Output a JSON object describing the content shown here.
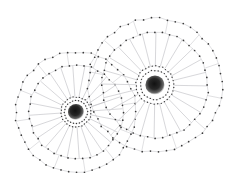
{
  "figure": {
    "background_color": "#ffffff",
    "width": 226,
    "height": 186
  },
  "style": {
    "rim_line_color": "#b9b9bf",
    "spoke_line_color": "#d2d2d6",
    "hub_ring_line_color": "#b0b0b6",
    "node_color": "#3a3a3a",
    "node_radius": 0.85,
    "rim_line_width": 0.45,
    "spoke_line_width": 0.9,
    "hub_core_color": "#111111",
    "hub_halo_color": "#8a8a8a"
  },
  "chart_data": {
    "type": "scatter",
    "xlabel": "",
    "ylabel": "",
    "xlim": [
      0,
      226
    ],
    "ylim": [
      0,
      186
    ],
    "grid": false,
    "legend": null,
    "series": [
      {
        "name": "left-wheel",
        "center": [
          76,
          112
        ],
        "outer_radius": 60,
        "inner_radius": 47,
        "hub_ring_outer_radius": 15,
        "hub_ring_inner_radius": 11.5,
        "hub_core_radius": 5.2,
        "spoke_count": 24,
        "outer_nodes": 48,
        "inner_nodes": 40,
        "hub_nodes": 30,
        "rotation_deg": 7
      },
      {
        "name": "right-wheel",
        "center": [
          155,
          85
        ],
        "outer_radius": 67,
        "inner_radius": 53,
        "hub_ring_outer_radius": 19,
        "hub_ring_inner_radius": 14.5,
        "hub_core_radius": 6.2,
        "spoke_count": 24,
        "outer_nodes": 52,
        "inner_nodes": 44,
        "hub_nodes": 34,
        "rotation_deg": -3
      }
    ]
  }
}
